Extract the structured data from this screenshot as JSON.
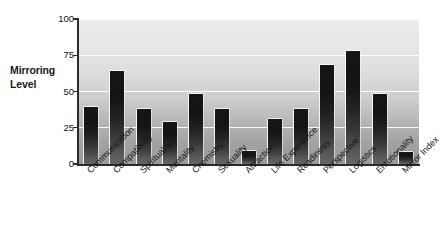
{
  "chart_data": {
    "type": "bar",
    "title": "",
    "subtitle": "",
    "xlabel": "",
    "ylabel": "Mirroring Level",
    "ylabel_lines": [
      "Mirroring",
      "Level"
    ],
    "ylim": [
      0,
      100
    ],
    "yticks": [
      0,
      25,
      50,
      75,
      100
    ],
    "ytick_labels": [
      "0",
      "25",
      "50",
      "75",
      "100"
    ],
    "grid": true,
    "grid_orientation": "horizontal",
    "grid_color": "#ffffff",
    "legend": false,
    "legend_position": "none",
    "label_rotation": -45,
    "plot_background": "vertical grayscale gradient light-to-dark",
    "bar_color": "#1a1a1a",
    "categories": [
      "Communication",
      "Compatibility",
      "Spirituality",
      "Mentality",
      "Chemistry",
      "Sexuality",
      "Attraction",
      "Life Experience",
      "Readiness",
      "Perspective",
      "Logistics",
      "Emotionality",
      "Mirror Index"
    ],
    "values": [
      39,
      64,
      38,
      29,
      48,
      38,
      9,
      31,
      38,
      68,
      78,
      48,
      8
    ]
  },
  "colors": {
    "axis": "#2b2b2b",
    "text": "#111111",
    "grid": "#ffffff",
    "bar_top": "#151515",
    "bar_bottom": "#666666",
    "plot_top": "#ececec",
    "plot_bottom": "#9a9a9a",
    "page_background": "#ffffff"
  }
}
